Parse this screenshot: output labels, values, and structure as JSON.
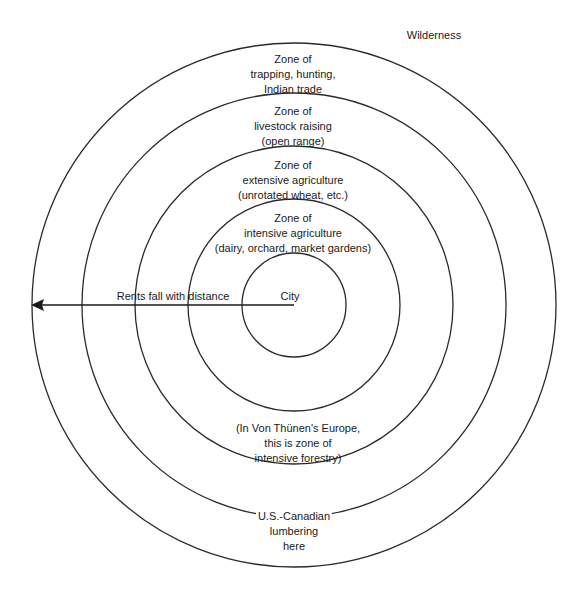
{
  "diagram": {
    "center": "City",
    "outside_label": "Wilderness",
    "arrow_label": "Rents fall with distance",
    "colors": {
      "line": "#2a2a2a",
      "text": "#1a1a1a",
      "background": "#ffffff"
    },
    "rings": [
      {
        "name": "city",
        "radius": 52
      },
      {
        "name": "intensive-agriculture",
        "radius": 106
      },
      {
        "name": "extensive-agriculture",
        "radius": 159
      },
      {
        "name": "livestock",
        "radius": 212
      },
      {
        "name": "trapping",
        "radius": 262
      }
    ],
    "zones": [
      {
        "line1": "Zone of",
        "line2": "trapping, hunting,",
        "line3": "Indian trade"
      },
      {
        "line1": "Zone of",
        "line2": "livestock raising",
        "line3": "(open range)"
      },
      {
        "line1": "Zone of",
        "line2": "extensive agriculture",
        "line3": "(unrotated wheat, etc.)"
      },
      {
        "line1": "Zone of",
        "line2": "intensive agriculture",
        "line3": "(dairy, orchard, market gardens)"
      }
    ],
    "forestry_note": {
      "line1": "(In Von Thünen's Europe,",
      "line2": "this is zone of",
      "line3": "intensive forestry)"
    },
    "lumbering_note": {
      "line1": "U.S.-Canadian",
      "line2": "lumbering",
      "line3": "here"
    }
  }
}
